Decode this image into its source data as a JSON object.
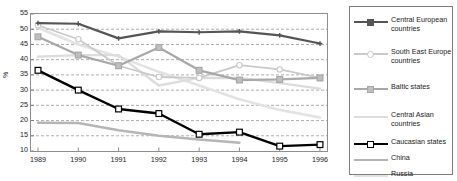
{
  "chart_data": {
    "type": "line",
    "title": "",
    "subtitle": "",
    "xlabel": "",
    "ylabel": "%",
    "x": [
      1989,
      1990,
      1991,
      1992,
      1993,
      1994,
      1995,
      1996
    ],
    "xtick_labels": [
      "1989",
      "1990",
      "1991",
      "1992",
      "1993",
      "1994",
      "1995",
      "1996"
    ],
    "ytick_labels": [
      "55",
      "50",
      "45",
      "40",
      "35",
      "30",
      "25",
      "20",
      "15",
      "10"
    ],
    "ylim": [
      10,
      55
    ],
    "ytick_step": 5,
    "grid": "horizontal-dashed",
    "legend_position": "right",
    "series": [
      {
        "name": "Central European countries",
        "color": "#555555",
        "marker": "plus",
        "marker_fill": "#555555",
        "line_width": 2.2,
        "values": [
          52.0,
          51.8,
          47.0,
          49.3,
          49.0,
          49.3,
          48.0,
          45.3
        ]
      },
      {
        "name": "South East Europe countries",
        "color": "#c9c9c9",
        "marker": "circle-open",
        "marker_fill": "#ffffff",
        "line_width": 1.8,
        "values": [
          51.3,
          46.7,
          38.0,
          34.3,
          34.0,
          38.2,
          36.8,
          34.0
        ]
      },
      {
        "name": "Baltic states",
        "color": "#a8a8a8",
        "marker": "square-open",
        "marker_fill": "#bfbfbf",
        "line_width": 2.2,
        "values": [
          47.5,
          41.5,
          38.0,
          44.0,
          36.5,
          33.3,
          33.5,
          34.0
        ]
      },
      {
        "name": "Central Asian countries",
        "color": "#dcdcdc",
        "marker": "none",
        "marker_fill": "#dcdcdc",
        "line_width": 2.4,
        "values": [
          41.0,
          41.5,
          41.5,
          31.5,
          34.0,
          34.0,
          32.3,
          30.5
        ]
      },
      {
        "name": "Caucasian states",
        "color": "#000000",
        "marker": "square-open",
        "marker_fill": "#ffffff",
        "line_width": 2.4,
        "values": [
          36.5,
          30.0,
          23.8,
          22.3,
          15.5,
          16.2,
          11.6,
          12.1
        ]
      },
      {
        "name": "China",
        "color": "#b5b5b5",
        "marker": "none",
        "marker_fill": "#b5b5b5",
        "line_width": 2.4,
        "values": [
          19.3,
          19.2,
          16.8,
          15.0,
          13.8,
          12.7,
          null,
          null
        ]
      },
      {
        "name": "Russia",
        "color": "#e2e2e2",
        "marker": "none",
        "marker_fill": "#e2e2e2",
        "line_width": 2.6,
        "values": [
          50.5,
          45.0,
          41.0,
          36.0,
          31.5,
          27.0,
          23.5,
          21.0
        ]
      }
    ]
  },
  "legend": {
    "entries": [
      {
        "label_line1": "Central European",
        "label_line2": "countries"
      },
      {
        "label_line1": "South East Europe",
        "label_line2": "countries"
      },
      {
        "label_line1": "Baltic states",
        "label_line2": ""
      },
      {
        "label_line1": "Central Asian",
        "label_line2": "countries"
      },
      {
        "label_line1": "Caucasian states",
        "label_line2": ""
      },
      {
        "label_line1": "China",
        "label_line2": ""
      },
      {
        "label_line1": "Russia",
        "label_line2": ""
      }
    ]
  }
}
